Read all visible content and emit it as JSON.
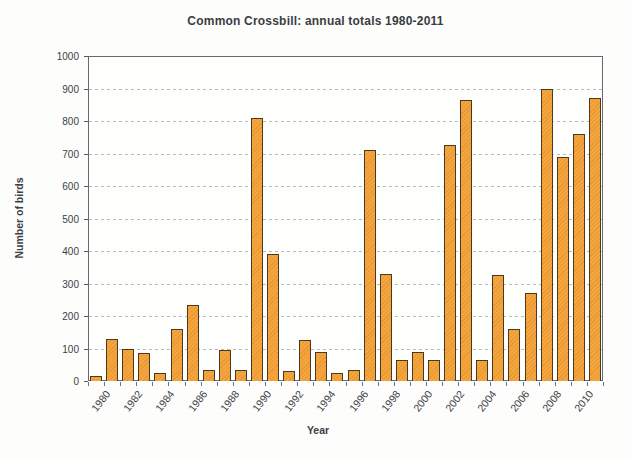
{
  "chart_data": {
    "type": "bar",
    "title": "Common Crossbill: annual totals 1980-2011",
    "xlabel": "Year",
    "ylabel": "Number of birds",
    "categories": [
      1980,
      1981,
      1982,
      1983,
      1984,
      1985,
      1986,
      1987,
      1988,
      1989,
      1990,
      1991,
      1992,
      1993,
      1994,
      1995,
      1996,
      1997,
      1998,
      1999,
      2000,
      2001,
      2002,
      2003,
      2004,
      2005,
      2006,
      2007,
      2008,
      2009,
      2010,
      2011
    ],
    "values": [
      15,
      130,
      100,
      85,
      25,
      160,
      235,
      35,
      95,
      35,
      810,
      390,
      30,
      125,
      90,
      25,
      35,
      710,
      330,
      65,
      90,
      65,
      725,
      865,
      65,
      325,
      160,
      270,
      900,
      690,
      760,
      870
    ],
    "ylim": [
      0,
      1000
    ],
    "ytick_interval": 100,
    "xtick_label_interval": 2,
    "grid": "horizontal-dashed",
    "legend": "none",
    "bar_color": "#F6A53C",
    "bar_border_color": "#4A3A1E",
    "x_tick_color": "#5B74A8",
    "frame_color": "#666A6E"
  }
}
